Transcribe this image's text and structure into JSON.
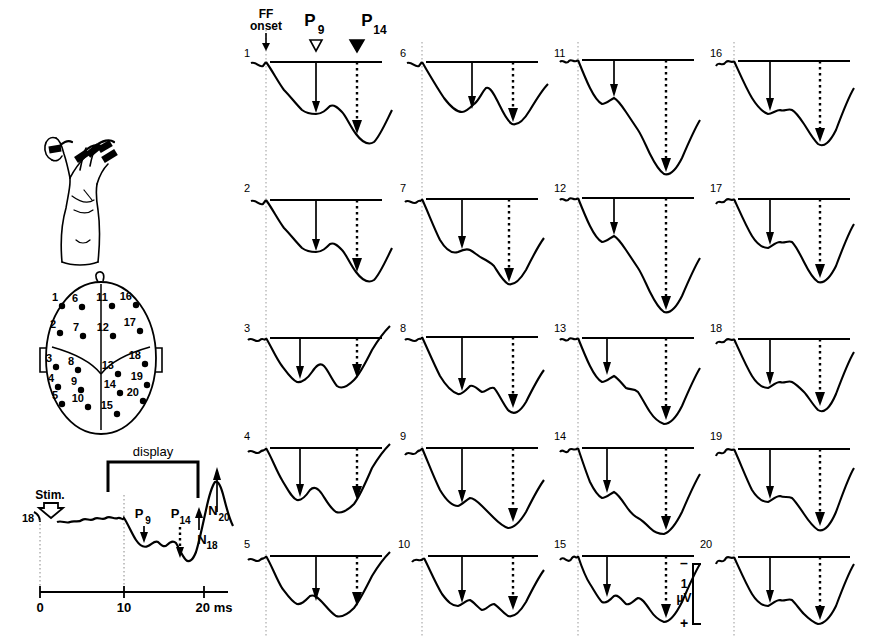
{
  "figure": {
    "title_markers": {
      "ff_onset_line1": "FF",
      "ff_onset_line2": "onset",
      "p9_label": "P",
      "p9_sub": "9",
      "p14_label": "P",
      "p14_sub": "14",
      "p9_marker": "open-triangle-down-icon",
      "p14_marker": "filled-triangle-down-icon"
    },
    "scale_bar": {
      "minus": "–",
      "value": "1",
      "unit": "µV",
      "plus": "+"
    },
    "trace_columns": [
      {
        "labels": [
          "1",
          "2",
          "3",
          "4",
          "5"
        ]
      },
      {
        "labels": [
          "6",
          "7",
          "8",
          "9",
          "10"
        ]
      },
      {
        "labels": [
          "11",
          "12",
          "13",
          "14",
          "15"
        ]
      },
      {
        "labels": [
          "16",
          "17",
          "18",
          "19",
          "20"
        ]
      }
    ],
    "hand": {
      "name": "hand-stimulation-diagram"
    },
    "head": {
      "name": "head-electrode-map",
      "electrodes": [
        {
          "label": "1",
          "x": 62,
          "y": 306
        },
        {
          "label": "6",
          "x": 82,
          "y": 307
        },
        {
          "label": "11",
          "x": 112,
          "y": 306
        },
        {
          "label": "16",
          "x": 136,
          "y": 305
        },
        {
          "label": "2",
          "x": 60,
          "y": 333
        },
        {
          "label": "7",
          "x": 83,
          "y": 336
        },
        {
          "label": "12",
          "x": 113,
          "y": 336
        },
        {
          "label": "17",
          "x": 140,
          "y": 331
        },
        {
          "label": "3",
          "x": 56,
          "y": 367
        },
        {
          "label": "8",
          "x": 78,
          "y": 370
        },
        {
          "label": "13",
          "x": 118,
          "y": 374
        },
        {
          "label": "18",
          "x": 145,
          "y": 364
        },
        {
          "label": "4",
          "x": 58,
          "y": 387
        },
        {
          "label": "9",
          "x": 81,
          "y": 390
        },
        {
          "label": "14",
          "x": 120,
          "y": 393
        },
        {
          "label": "19",
          "x": 147,
          "y": 385
        },
        {
          "label": "5",
          "x": 62,
          "y": 404
        },
        {
          "label": "10",
          "x": 88,
          "y": 407
        },
        {
          "label": "20",
          "x": 143,
          "y": 401
        },
        {
          "label": "15",
          "x": 117,
          "y": 414
        }
      ]
    },
    "inset": {
      "name": "overview-waveform-inset",
      "stim_label": "Stim.",
      "trace_label": "18",
      "display_label": "display",
      "peaks": [
        {
          "label": "P",
          "sub": "9",
          "dir": "down",
          "style": "solid"
        },
        {
          "label": "P",
          "sub": "14",
          "dir": "down",
          "style": "dotted"
        },
        {
          "label": "N",
          "sub": "18",
          "dir": "up",
          "style": "solid"
        },
        {
          "label": "N",
          "sub": "20",
          "dir": "up",
          "style": "solid"
        }
      ],
      "axis": {
        "ticks": [
          "0",
          "10",
          "20 ms"
        ],
        "unit": "ms"
      }
    }
  },
  "chart_data": {
    "type": "line",
    "xlabel": "Time (ms)",
    "ylabel": "Amplitude (µV)",
    "xlim": [
      0,
      22
    ],
    "ylim": [
      -1.5,
      1.5
    ],
    "grid": false,
    "annotations": [
      "FF onset",
      "P9",
      "P14",
      "N18",
      "N20",
      "display",
      "Stim."
    ],
    "series": [
      {
        "name": "1",
        "values": [
          0.05,
          0.0,
          -0.05,
          0.02,
          0.06,
          0.0,
          -0.2,
          -0.45,
          -0.6,
          -0.72,
          -0.68,
          -0.74,
          -0.7,
          -0.62,
          -0.6,
          -0.68,
          -0.72,
          -1.0,
          -1.15,
          -1.0,
          -0.55,
          -0.2
        ]
      },
      {
        "name": "2",
        "values": [
          0.04,
          0.0,
          -0.04,
          0.03,
          0.05,
          0.0,
          -0.22,
          -0.5,
          -0.65,
          -0.75,
          -0.7,
          -0.76,
          -0.72,
          -0.64,
          -0.62,
          -0.72,
          -0.8,
          -1.05,
          -1.2,
          -1.02,
          -0.5,
          -0.18
        ]
      },
      {
        "name": "3",
        "values": [
          0.06,
          0.02,
          -0.02,
          0.05,
          0.08,
          0.0,
          -0.3,
          -0.6,
          -0.78,
          -0.85,
          -0.7,
          -0.6,
          -0.72,
          -0.8,
          -0.85,
          -0.95,
          -1.1,
          -1.2,
          -1.1,
          -0.7,
          -0.25,
          0.1
        ]
      },
      {
        "name": "4",
        "values": [
          0.05,
          0.0,
          -0.03,
          0.06,
          0.1,
          0.0,
          -0.35,
          -0.7,
          -0.9,
          -1.0,
          -0.85,
          -0.95,
          -1.0,
          -1.05,
          -1.1,
          -1.15,
          -1.25,
          -1.3,
          -1.15,
          -0.7,
          -0.25,
          0.05
        ]
      },
      {
        "name": "5",
        "values": [
          0.04,
          0.0,
          -0.04,
          0.04,
          0.07,
          0.0,
          -0.3,
          -0.65,
          -0.85,
          -0.95,
          -0.82,
          -0.9,
          -0.95,
          -1.0,
          -1.05,
          -1.12,
          -1.2,
          -1.25,
          -1.1,
          -0.65,
          -0.2,
          0.08
        ]
      },
      {
        "name": "6",
        "values": [
          0.05,
          0.0,
          -0.05,
          0.03,
          0.07,
          0.0,
          -0.25,
          -0.55,
          -0.72,
          -0.8,
          -0.75,
          -0.62,
          -0.58,
          -0.65,
          -0.78,
          -0.9,
          -1.05,
          -1.12,
          -1.0,
          -0.6,
          -0.2,
          0.12
        ]
      },
      {
        "name": "7",
        "values": [
          0.05,
          0.0,
          -0.04,
          0.04,
          0.06,
          0.0,
          -0.28,
          -0.58,
          -0.75,
          -0.82,
          -0.78,
          -0.7,
          -0.68,
          -0.75,
          -0.85,
          -0.98,
          -1.1,
          -1.18,
          -1.02,
          -0.6,
          -0.18,
          0.1
        ]
      },
      {
        "name": "8",
        "values": [
          0.06,
          0.0,
          -0.05,
          0.05,
          0.08,
          0.0,
          -0.35,
          -0.72,
          -0.9,
          -0.95,
          -0.85,
          -0.78,
          -0.85,
          -0.95,
          -1.05,
          -1.15,
          -1.3,
          -1.35,
          -1.15,
          -0.68,
          -0.22,
          0.1
        ]
      },
      {
        "name": "9",
        "values": [
          0.05,
          0.0,
          -0.05,
          0.04,
          0.08,
          0.0,
          -0.38,
          -0.78,
          -0.95,
          -1.05,
          -0.95,
          -1.0,
          -1.05,
          -1.1,
          -1.15,
          -1.2,
          -1.3,
          -1.35,
          -1.15,
          -0.65,
          -0.2,
          0.08
        ]
      },
      {
        "name": "10",
        "values": [
          0.05,
          0.0,
          -0.04,
          0.05,
          0.07,
          0.0,
          -0.32,
          -0.68,
          -0.88,
          -0.95,
          -0.88,
          -0.92,
          -0.98,
          -1.05,
          -1.1,
          -1.18,
          -1.28,
          -1.3,
          -1.1,
          -0.62,
          -0.18,
          0.1
        ]
      },
      {
        "name": "11",
        "values": [
          0.06,
          0.02,
          -0.03,
          0.06,
          0.08,
          0.0,
          -0.3,
          -0.6,
          -0.75,
          -0.7,
          -0.62,
          -0.72,
          -0.85,
          -0.95,
          -1.05,
          -1.15,
          -1.25,
          -1.35,
          -1.2,
          -0.75,
          -0.3,
          0.05
        ]
      },
      {
        "name": "12",
        "values": [
          0.05,
          0.0,
          -0.04,
          0.05,
          0.07,
          0.0,
          -0.28,
          -0.58,
          -0.72,
          -0.68,
          -0.6,
          -0.7,
          -0.82,
          -0.92,
          -1.02,
          -1.12,
          -1.25,
          -1.32,
          -1.18,
          -0.72,
          -0.25,
          0.08
        ]
      },
      {
        "name": "13",
        "values": [
          0.05,
          0.0,
          -0.05,
          0.04,
          0.08,
          0.0,
          -0.32,
          -0.62,
          -0.75,
          -0.7,
          -0.68,
          -0.78,
          -0.88,
          -0.98,
          -1.08,
          -1.18,
          -1.3,
          -1.35,
          -1.15,
          -0.68,
          -0.22,
          0.1
        ]
      },
      {
        "name": "14",
        "values": [
          0.05,
          0.0,
          -0.04,
          0.05,
          0.07,
          0.0,
          -0.35,
          -0.7,
          -0.88,
          -0.85,
          -0.8,
          -0.9,
          -1.0,
          -1.08,
          -1.15,
          -1.22,
          -1.32,
          -1.38,
          -1.18,
          -0.7,
          -0.22,
          0.08
        ]
      },
      {
        "name": "15",
        "values": [
          0.05,
          0.0,
          -0.05,
          0.04,
          0.06,
          0.0,
          -0.3,
          -0.6,
          -0.78,
          -0.72,
          -0.68,
          -0.8,
          -0.88,
          -0.95,
          -1.05,
          -1.15,
          -1.28,
          -1.32,
          -1.12,
          -0.65,
          -0.2,
          0.1
        ]
      },
      {
        "name": "16",
        "values": [
          0.05,
          0.02,
          -0.03,
          0.06,
          0.08,
          0.0,
          -0.28,
          -0.58,
          -0.72,
          -0.68,
          -0.65,
          -0.7,
          -0.78,
          -0.88,
          -1.0,
          -1.12,
          -1.25,
          -1.3,
          -1.1,
          -0.6,
          -0.15,
          0.15
        ]
      },
      {
        "name": "17",
        "values": [
          0.05,
          0.0,
          -0.04,
          0.05,
          0.07,
          0.0,
          -0.3,
          -0.62,
          -0.75,
          -0.7,
          -0.68,
          -0.75,
          -0.85,
          -0.95,
          -1.05,
          -1.15,
          -1.28,
          -1.32,
          -1.1,
          -0.62,
          -0.18,
          0.12
        ]
      },
      {
        "name": "18",
        "values": [
          0.05,
          0.0,
          -0.05,
          0.06,
          0.08,
          0.0,
          -0.35,
          -0.68,
          -0.82,
          -0.75,
          -0.72,
          -0.78,
          -0.82,
          -0.92,
          -1.02,
          -1.15,
          -1.28,
          -1.3,
          -1.08,
          -0.58,
          -0.15,
          0.15
        ]
      },
      {
        "name": "19",
        "values": [
          0.05,
          0.0,
          -0.04,
          0.05,
          0.07,
          0.0,
          -0.32,
          -0.65,
          -0.8,
          -0.78,
          -0.75,
          -0.82,
          -0.9,
          -1.0,
          -1.08,
          -1.18,
          -1.3,
          -1.32,
          -1.1,
          -0.6,
          -0.18,
          0.12
        ]
      },
      {
        "name": "20",
        "values": [
          0.05,
          0.0,
          -0.05,
          0.04,
          0.07,
          0.0,
          -0.3,
          -0.62,
          -0.78,
          -0.72,
          -0.7,
          -0.78,
          -0.88,
          -0.98,
          -1.05,
          -1.15,
          -1.25,
          -1.3,
          -1.08,
          -0.58,
          -0.15,
          0.14
        ]
      }
    ],
    "inset_trace": {
      "name": "18",
      "x": [
        0,
        1,
        2,
        3,
        4,
        5,
        6,
        7,
        8,
        9,
        10,
        11,
        12,
        13,
        14,
        15,
        16,
        17,
        18,
        19,
        20,
        21
      ],
      "values": [
        0,
        0.05,
        0.08,
        0.04,
        0.1,
        0.06,
        0.12,
        0.07,
        0.1,
        0.05,
        0.02,
        -0.25,
        -0.5,
        -0.45,
        -0.55,
        -0.5,
        -0.75,
        -0.9,
        -0.7,
        0.3,
        1.15,
        0.4
      ]
    }
  }
}
